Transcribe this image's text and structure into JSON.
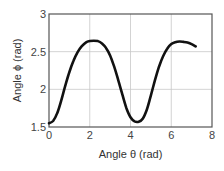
{
  "chart_data": {
    "type": "line",
    "title": "",
    "xlabel": "Angle θ (rad)",
    "ylabel": "Angle ϕ (rad)",
    "xlim": [
      0,
      8
    ],
    "ylim": [
      1.5,
      3
    ],
    "xticks": [
      0,
      2,
      4,
      6,
      8
    ],
    "yticks": [
      1.5,
      2,
      2.5,
      3
    ],
    "xtick_labels": [
      "0",
      "2",
      "4",
      "6",
      "8"
    ],
    "ytick_labels": [
      "1.5",
      "2",
      "2.5",
      "3"
    ],
    "grid": true,
    "legend": null,
    "series": [
      {
        "name": "phi(theta)",
        "color": "#111111",
        "x": [
          0.0,
          0.2,
          0.4,
          0.6,
          0.8,
          1.0,
          1.2,
          1.4,
          1.6,
          1.8,
          2.0,
          2.2,
          2.4,
          2.6,
          2.8,
          3.0,
          3.2,
          3.4,
          3.6,
          3.8,
          4.0,
          4.2,
          4.4,
          4.6,
          4.8,
          5.0,
          5.2,
          5.4,
          5.6,
          5.8,
          6.0,
          6.2,
          6.4,
          6.6,
          6.8,
          7.0,
          7.2
        ],
        "y": [
          1.55,
          1.58,
          1.68,
          1.85,
          2.05,
          2.23,
          2.38,
          2.49,
          2.57,
          2.62,
          2.64,
          2.645,
          2.64,
          2.61,
          2.55,
          2.45,
          2.3,
          2.12,
          1.93,
          1.75,
          1.63,
          1.575,
          1.57,
          1.61,
          1.73,
          1.92,
          2.12,
          2.3,
          2.44,
          2.54,
          2.6,
          2.625,
          2.635,
          2.63,
          2.62,
          2.6,
          2.57
        ]
      }
    ]
  }
}
